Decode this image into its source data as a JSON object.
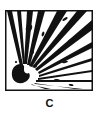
{
  "symbol": {
    "icon": "explosive-hazard-icon",
    "border_color": "#111111",
    "fill_color": "#ffffff"
  },
  "label": "C"
}
